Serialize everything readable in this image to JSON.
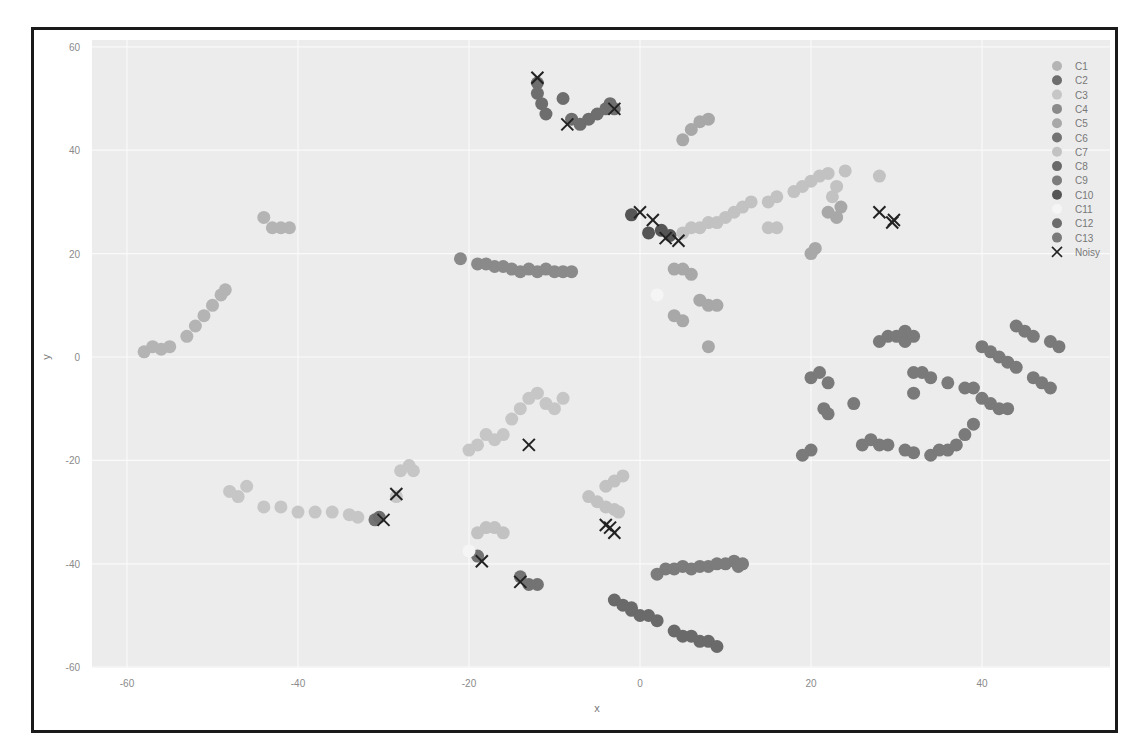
{
  "chart_data": {
    "type": "scatter",
    "title": "",
    "xlabel": "x",
    "ylabel": "y",
    "xlim": [
      -64,
      55
    ],
    "ylim": [
      -60,
      62
    ],
    "xticks": [
      -60,
      -40,
      -20,
      0,
      20,
      40
    ],
    "yticks": [
      60,
      40,
      20,
      0,
      -20,
      -40,
      -60
    ],
    "grid": true,
    "legend_position": "upper right",
    "legend": [
      "C1",
      "C2",
      "C3",
      "C4",
      "C5",
      "C6",
      "C7",
      "C8",
      "C9",
      "C10",
      "C11",
      "C12",
      "C13",
      "Noisy"
    ],
    "series": [
      {
        "name": "C1",
        "color": "#b4b4b4",
        "points": [
          [
            -58,
            1
          ],
          [
            -57,
            2
          ],
          [
            -56,
            1.5
          ],
          [
            -55,
            2
          ],
          [
            -53,
            4
          ],
          [
            -52,
            6
          ],
          [
            -51,
            8
          ],
          [
            -50,
            10
          ],
          [
            -49,
            12
          ],
          [
            -48.5,
            13
          ],
          [
            -44,
            27
          ],
          [
            -43,
            25
          ],
          [
            -42,
            25
          ],
          [
            -41,
            25
          ]
        ]
      },
      {
        "name": "C2",
        "color": "#6e6e6e",
        "points": [
          [
            -12,
            53
          ],
          [
            -12,
            51
          ],
          [
            -11.5,
            49
          ],
          [
            -11,
            47
          ],
          [
            -9,
            50
          ],
          [
            -8,
            46
          ],
          [
            -7,
            45
          ],
          [
            -6,
            46
          ],
          [
            -5,
            47
          ],
          [
            -4,
            48
          ],
          [
            -3.5,
            49
          ],
          [
            -3,
            48
          ]
        ]
      },
      {
        "name": "C3",
        "color": "#c6c6c6",
        "points": [
          [
            -48,
            -26
          ],
          [
            -47,
            -27
          ],
          [
            -46,
            -25
          ],
          [
            -44,
            -29
          ],
          [
            -42,
            -29
          ],
          [
            -40,
            -30
          ],
          [
            -38,
            -30
          ],
          [
            -36,
            -30
          ],
          [
            -34,
            -30.5
          ],
          [
            -33,
            -31
          ],
          [
            -28,
            -22
          ],
          [
            -27,
            -21
          ],
          [
            -26.5,
            -22
          ],
          [
            -28.5,
            -27
          ],
          [
            -20,
            -18
          ],
          [
            -19,
            -17
          ],
          [
            -18,
            -15
          ],
          [
            -17,
            -16
          ],
          [
            -16,
            -15
          ],
          [
            -15,
            -12
          ],
          [
            -14,
            -10
          ],
          [
            -13,
            -8
          ],
          [
            -12,
            -7
          ],
          [
            -11,
            -9
          ],
          [
            -10,
            -10
          ],
          [
            -9,
            -8
          ]
        ]
      },
      {
        "name": "C4",
        "color": "#8a8a8a",
        "points": [
          [
            -21,
            19
          ],
          [
            -19,
            18
          ],
          [
            -18,
            18
          ],
          [
            -17,
            17.5
          ],
          [
            -16,
            17.5
          ],
          [
            -15,
            17
          ],
          [
            -14,
            16.5
          ],
          [
            -13,
            17
          ],
          [
            -12,
            16.5
          ],
          [
            -11,
            17
          ],
          [
            -10,
            16.5
          ],
          [
            -9,
            16.5
          ],
          [
            -8,
            16.5
          ]
        ]
      },
      {
        "name": "C5",
        "color": "#a8a8a8",
        "points": [
          [
            5,
            42
          ],
          [
            6,
            44
          ],
          [
            7,
            45.5
          ],
          [
            8,
            46
          ],
          [
            4,
            17
          ],
          [
            5,
            17
          ],
          [
            6,
            16
          ],
          [
            4,
            8
          ],
          [
            5,
            7
          ],
          [
            7,
            11
          ],
          [
            8,
            10
          ],
          [
            9,
            10
          ],
          [
            8,
            2
          ],
          [
            20,
            20
          ],
          [
            20.5,
            21
          ],
          [
            22,
            28
          ],
          [
            23,
            27
          ],
          [
            23.5,
            29
          ]
        ]
      },
      {
        "name": "C6",
        "color": "#737373",
        "points": [
          [
            -31,
            -31.5
          ],
          [
            -14,
            -42.5
          ],
          [
            -13,
            -44
          ],
          [
            -12,
            -44
          ],
          [
            -19,
            -38.5
          ]
        ]
      },
      {
        "name": "C7",
        "color": "#c2c2c2",
        "points": [
          [
            5,
            24
          ],
          [
            6,
            25
          ],
          [
            7,
            25
          ],
          [
            8,
            26
          ],
          [
            9,
            26
          ],
          [
            10,
            27
          ],
          [
            11,
            28
          ],
          [
            12,
            29
          ],
          [
            13,
            30
          ],
          [
            15,
            30
          ],
          [
            16,
            31
          ],
          [
            18,
            32
          ],
          [
            19,
            33
          ],
          [
            20,
            34
          ],
          [
            21,
            35
          ],
          [
            22,
            35.5
          ],
          [
            24,
            36
          ],
          [
            23,
            33
          ],
          [
            22.5,
            31
          ],
          [
            15,
            25
          ],
          [
            16,
            25
          ],
          [
            28,
            35
          ],
          [
            -4,
            -25
          ],
          [
            -3,
            -24
          ],
          [
            -2,
            -23
          ],
          [
            -6,
            -27
          ],
          [
            -5,
            -28
          ],
          [
            -4,
            -29
          ],
          [
            -3,
            -29.5
          ],
          [
            -2.5,
            -30
          ],
          [
            -19,
            -34
          ],
          [
            -18,
            -33
          ],
          [
            -17,
            -33
          ],
          [
            -16,
            -34
          ]
        ]
      },
      {
        "name": "C8",
        "color": "#6a6a6a",
        "points": [
          [
            -3,
            -47
          ],
          [
            -2,
            -48
          ],
          [
            -1,
            -49
          ],
          [
            0,
            -50
          ],
          [
            1,
            -50
          ],
          [
            2,
            -51
          ],
          [
            4,
            -53
          ],
          [
            5,
            -54
          ],
          [
            6,
            -54
          ],
          [
            7,
            -55
          ],
          [
            8,
            -55
          ],
          [
            9,
            -56
          ],
          [
            -1,
            -48.5
          ]
        ]
      },
      {
        "name": "C9",
        "color": "#7c7c7c",
        "points": [
          [
            2,
            -42
          ],
          [
            3,
            -41
          ],
          [
            4,
            -41
          ],
          [
            5,
            -40.5
          ],
          [
            6,
            -41
          ],
          [
            7,
            -40.5
          ],
          [
            8,
            -40.5
          ],
          [
            9,
            -40
          ],
          [
            10,
            -40
          ],
          [
            11,
            -39.5
          ],
          [
            12,
            -40
          ],
          [
            11.5,
            -40.5
          ]
        ]
      },
      {
        "name": "C10",
        "color": "#555555",
        "points": [
          [
            1,
            24
          ],
          [
            2.5,
            24.5
          ],
          [
            3.5,
            23.5
          ],
          [
            -1,
            27.5
          ]
        ]
      },
      {
        "name": "C11",
        "color": "#f5f5f5",
        "points": [
          [
            2,
            12
          ],
          [
            -20,
            -37.5
          ]
        ]
      },
      {
        "name": "C12",
        "color": "#6c6c6c",
        "points": [
          [
            -30.5,
            -31
          ]
        ]
      },
      {
        "name": "C13",
        "color": "#7a7a7a",
        "points": [
          [
            20,
            -4
          ],
          [
            21,
            -3
          ],
          [
            22,
            -5
          ],
          [
            21.5,
            -10
          ],
          [
            22,
            -11
          ],
          [
            20,
            -18
          ],
          [
            19,
            -19
          ],
          [
            25,
            -9
          ],
          [
            26,
            -17
          ],
          [
            27,
            -16
          ],
          [
            28,
            -17
          ],
          [
            29,
            -17
          ],
          [
            31,
            -18
          ],
          [
            32,
            -18.5
          ],
          [
            34,
            -19
          ],
          [
            35,
            -18
          ],
          [
            36,
            -18
          ],
          [
            37,
            -17
          ],
          [
            38,
            -15
          ],
          [
            39,
            -13
          ],
          [
            32,
            -3
          ],
          [
            34,
            -4
          ],
          [
            28,
            3
          ],
          [
            29,
            4
          ],
          [
            30,
            4
          ],
          [
            31,
            3
          ],
          [
            32,
            4
          ],
          [
            31,
            5
          ],
          [
            33,
            -3
          ],
          [
            40,
            2
          ],
          [
            41,
            1
          ],
          [
            42,
            0
          ],
          [
            43,
            -1
          ],
          [
            44,
            -2
          ],
          [
            39,
            -6
          ],
          [
            40,
            -8
          ],
          [
            41,
            -9
          ],
          [
            42,
            -10
          ],
          [
            43,
            -10
          ],
          [
            44,
            6
          ],
          [
            45,
            5
          ],
          [
            46,
            4
          ],
          [
            48,
            3
          ],
          [
            49,
            2
          ],
          [
            46,
            -4
          ],
          [
            47,
            -5
          ],
          [
            48,
            -6
          ],
          [
            36,
            -5
          ],
          [
            38,
            -6
          ],
          [
            32,
            -7
          ]
        ]
      },
      {
        "name": "Noisy",
        "color": "#222222",
        "marker": "x",
        "points": [
          [
            -12,
            54
          ],
          [
            -8.5,
            45
          ],
          [
            -3,
            48
          ],
          [
            0,
            28
          ],
          [
            1.5,
            26.5
          ],
          [
            3,
            23
          ],
          [
            4.5,
            22.5
          ],
          [
            28,
            28
          ],
          [
            29.5,
            26
          ],
          [
            29.7,
            26.5
          ],
          [
            -13,
            -17
          ],
          [
            -28.5,
            -26.5
          ],
          [
            -30,
            -31.5
          ],
          [
            -18.5,
            -39.5
          ],
          [
            -14,
            -43.5
          ],
          [
            -4,
            -32.5
          ],
          [
            -3.5,
            -33
          ],
          [
            -3,
            -34
          ]
        ]
      }
    ]
  }
}
